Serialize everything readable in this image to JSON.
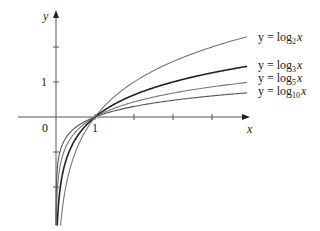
{
  "chart_data": {
    "type": "line",
    "title": "",
    "xlabel": "x",
    "ylabel": "y",
    "x_tick_labels": [
      {
        "x": 1,
        "label": "1"
      }
    ],
    "y_tick_labels": [
      {
        "y": 1,
        "label": "1"
      }
    ],
    "origin_label": "0",
    "x_ticks": [
      1,
      2,
      3,
      4
    ],
    "y_ticks": [
      -2,
      -1,
      1,
      2
    ],
    "xlim": [
      -0.8,
      5.0
    ],
    "ylim": [
      -3.2,
      3.2
    ],
    "grid": false,
    "legend_position": "inline-right",
    "series": [
      {
        "name": "y = log2 x",
        "base": 2,
        "stroke": "#777777",
        "width": 1.1,
        "label_prefix": "y = log",
        "label_sub": "2",
        "label_var": "x",
        "points": [
          [
            0.05,
            -4.32
          ],
          [
            0.1,
            -3.32
          ],
          [
            0.25,
            -2.0
          ],
          [
            0.5,
            -1.0
          ],
          [
            1,
            0
          ],
          [
            2,
            1
          ],
          [
            3,
            1.58
          ],
          [
            4,
            2.0
          ],
          [
            4.9,
            2.29
          ]
        ]
      },
      {
        "name": "y = log3 x",
        "base": 3,
        "stroke": "#222222",
        "width": 1.6,
        "label_prefix": "y = log",
        "label_sub": "3",
        "label_var": "x",
        "points": [
          [
            0.05,
            -2.73
          ],
          [
            0.1,
            -2.1
          ],
          [
            0.25,
            -1.26
          ],
          [
            0.5,
            -0.63
          ],
          [
            1,
            0
          ],
          [
            2,
            0.63
          ],
          [
            3,
            1.0
          ],
          [
            4,
            1.26
          ],
          [
            4.9,
            1.45
          ]
        ]
      },
      {
        "name": "y = log5 x",
        "base": 5,
        "stroke": "#777777",
        "width": 1.1,
        "label_prefix": "y = log",
        "label_sub": "5",
        "label_var": "x",
        "points": [
          [
            0.05,
            -1.86
          ],
          [
            0.1,
            -1.43
          ],
          [
            0.25,
            -0.86
          ],
          [
            0.5,
            -0.43
          ],
          [
            1,
            0
          ],
          [
            2,
            0.43
          ],
          [
            3,
            0.68
          ],
          [
            4,
            0.86
          ],
          [
            4.9,
            0.99
          ]
        ]
      },
      {
        "name": "y = log10 x",
        "base": 10,
        "stroke": "#555555",
        "width": 1.1,
        "label_prefix": "y = log",
        "label_sub": "10",
        "label_var": "x",
        "points": [
          [
            0.05,
            -1.3
          ],
          [
            0.1,
            -1.0
          ],
          [
            0.25,
            -0.6
          ],
          [
            0.5,
            -0.3
          ],
          [
            1,
            0
          ],
          [
            2,
            0.3
          ],
          [
            3,
            0.48
          ],
          [
            4,
            0.6
          ],
          [
            4.9,
            0.69
          ]
        ]
      }
    ]
  },
  "layout": {
    "origin_px": [
      56,
      117
    ],
    "unit_x_px": 39,
    "unit_y_px": 35,
    "x_axis_start_px": 18,
    "x_axis_end_px": 250,
    "y_axis_top_px": 10,
    "y_axis_bottom_px": 225,
    "curve_x_end": 4.9,
    "curve_y_floor": -3.1,
    "label_x_px": 258,
    "label_y_px": [
      41,
      69,
      82,
      95
    ]
  }
}
